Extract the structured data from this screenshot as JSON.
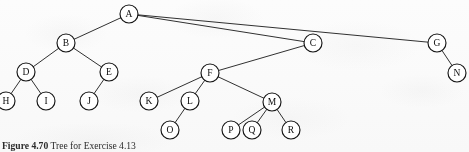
{
  "figure": {
    "caption_prefix": "Figure 4.70",
    "caption_text": "Tree for Exercise 4.13",
    "background_color": "#fdfdfd",
    "stroke_color": "#151515"
  },
  "diagram": {
    "type": "tree",
    "node_radius": 9,
    "nodes": [
      {
        "id": "A",
        "label": "A",
        "x": 129,
        "y": 14
      },
      {
        "id": "B",
        "label": "B",
        "x": 66,
        "y": 43
      },
      {
        "id": "C",
        "label": "C",
        "x": 313,
        "y": 43
      },
      {
        "id": "G",
        "label": "G",
        "x": 437,
        "y": 43
      },
      {
        "id": "D",
        "label": "D",
        "x": 26,
        "y": 72
      },
      {
        "id": "E",
        "label": "E",
        "x": 109,
        "y": 72
      },
      {
        "id": "F",
        "label": "F",
        "x": 210,
        "y": 73
      },
      {
        "id": "N",
        "label": "N",
        "x": 457,
        "y": 73
      },
      {
        "id": "H",
        "label": "H",
        "x": 6,
        "y": 101
      },
      {
        "id": "I",
        "label": "I",
        "x": 46,
        "y": 101
      },
      {
        "id": "J",
        "label": "J",
        "x": 89,
        "y": 101
      },
      {
        "id": "K",
        "label": "K",
        "x": 149,
        "y": 101
      },
      {
        "id": "L",
        "label": "L",
        "x": 190,
        "y": 101
      },
      {
        "id": "M",
        "label": "M",
        "x": 272,
        "y": 102
      },
      {
        "id": "O",
        "label": "O",
        "x": 170,
        "y": 130
      },
      {
        "id": "P",
        "label": "P",
        "x": 231,
        "y": 130
      },
      {
        "id": "Q",
        "label": "Q",
        "x": 252,
        "y": 130
      },
      {
        "id": "R",
        "label": "R",
        "x": 291,
        "y": 130
      }
    ],
    "edges": [
      {
        "from": "A",
        "to": "B"
      },
      {
        "from": "A",
        "to": "C"
      },
      {
        "from": "A",
        "to": "G"
      },
      {
        "from": "B",
        "to": "D"
      },
      {
        "from": "B",
        "to": "E"
      },
      {
        "from": "C",
        "to": "F"
      },
      {
        "from": "G",
        "to": "N"
      },
      {
        "from": "D",
        "to": "H"
      },
      {
        "from": "D",
        "to": "I"
      },
      {
        "from": "E",
        "to": "J"
      },
      {
        "from": "F",
        "to": "K"
      },
      {
        "from": "F",
        "to": "L"
      },
      {
        "from": "F",
        "to": "M"
      },
      {
        "from": "L",
        "to": "O"
      },
      {
        "from": "M",
        "to": "P"
      },
      {
        "from": "M",
        "to": "Q"
      },
      {
        "from": "M",
        "to": "R"
      }
    ]
  }
}
